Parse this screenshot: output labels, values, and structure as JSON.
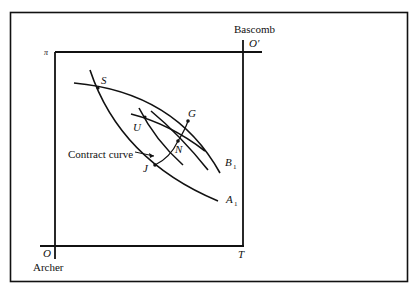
{
  "diagram": {
    "type": "edgeworth-box",
    "origins": {
      "archer": {
        "symbol": "O",
        "name": "Archer"
      },
      "bascomb": {
        "symbol": "O′",
        "name": "Bascomb"
      }
    },
    "axis_labels": {
      "top_left": "π",
      "bottom_right": "T"
    },
    "points": {
      "S": "S",
      "G": "G",
      "U": "U",
      "N": "N",
      "J": "J"
    },
    "curves": {
      "A1": {
        "letter": "A",
        "sub": "1"
      },
      "B1": {
        "letter": "B",
        "sub": "1"
      }
    },
    "annotation": "Contract curve"
  }
}
